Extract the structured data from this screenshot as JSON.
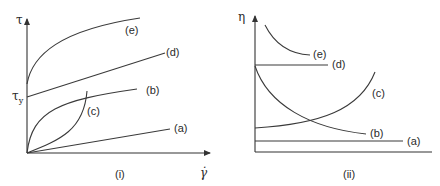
{
  "panels": [
    {
      "id": "i",
      "caption": "(i)",
      "y_axis_label": "τ",
      "yield_label": "τ",
      "yield_subscript": "y",
      "x_axis_label": "γ̇",
      "curves": [
        {
          "id": "a",
          "label": "(a)",
          "description": "Newtonian - straight line through origin"
        },
        {
          "id": "b",
          "label": "(b)",
          "description": "Shear-thinning (pseudoplastic) - concave curve from origin"
        },
        {
          "id": "c",
          "label": "(c)",
          "description": "Shear-thickening (dilatant) - convex curve from origin"
        },
        {
          "id": "d",
          "label": "(d)",
          "description": "Bingham plastic - straight line starting at yield stress"
        },
        {
          "id": "e",
          "label": "(e)",
          "description": "Yield-pseudoplastic - concave curve starting above yield"
        }
      ]
    },
    {
      "id": "ii",
      "caption": "(ii)",
      "y_axis_label": "η",
      "curves": [
        {
          "id": "a",
          "label": "(a)",
          "description": "constant low viscosity"
        },
        {
          "id": "b",
          "label": "(b)",
          "description": "decreasing viscosity"
        },
        {
          "id": "c",
          "label": "(c)",
          "description": "increasing viscosity"
        },
        {
          "id": "d",
          "label": "(d)",
          "description": "constant high viscosity"
        },
        {
          "id": "e",
          "label": "(e)",
          "description": "decreasing viscosity, high"
        }
      ]
    }
  ],
  "colors": {
    "line": "#3a3a3a",
    "text": "#2a2a2a",
    "background": "#ffffff"
  }
}
